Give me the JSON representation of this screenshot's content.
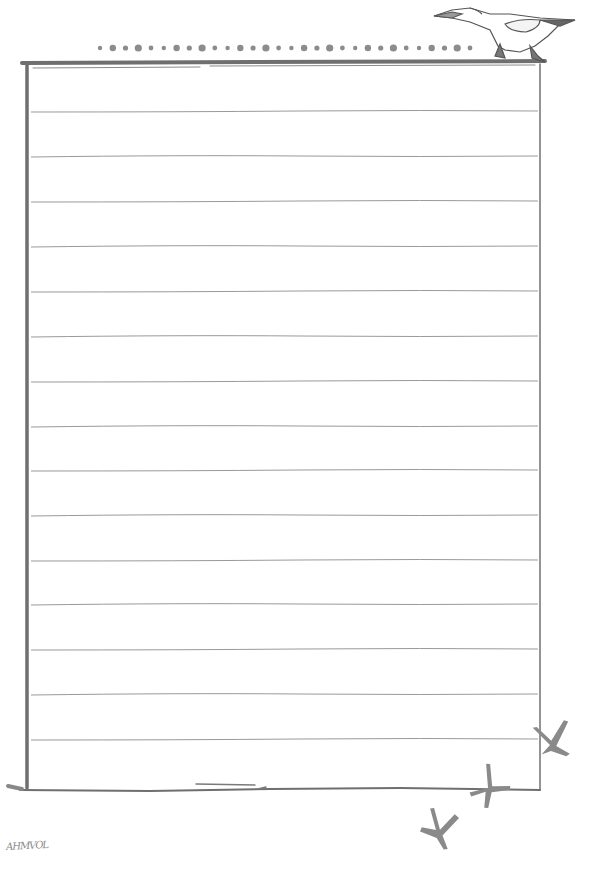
{
  "page": {
    "type": "lined stationery sheet",
    "background": "#ffffff",
    "frame_color": "#6f6f6f",
    "line_color": "#9a9a9a",
    "ornament_color": "#8c8c8c"
  },
  "frame": {
    "left": 26,
    "top": 62,
    "right": 540,
    "bottom": 790
  },
  "ruled_lines": [
    111,
    156,
    201,
    246,
    291,
    336,
    381,
    426,
    470,
    515,
    560,
    604,
    649,
    694,
    739
  ],
  "dot_border": {
    "count": 30,
    "y": 48,
    "x_start": 100,
    "x_end": 470
  },
  "decorations": {
    "top_right": "gannet-bird-illustration",
    "bottom_right": "bird-footprints",
    "footprint_count": 3
  },
  "signature": {
    "text": "AHMVOL"
  }
}
